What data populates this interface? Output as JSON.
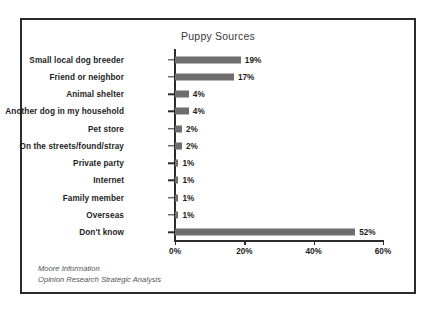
{
  "chart_data": {
    "type": "bar",
    "orientation": "horizontal",
    "title": "Puppy Sources",
    "xlabel": "",
    "ylabel": "",
    "xlim": [
      0,
      62
    ],
    "xticks": [
      0,
      20,
      40,
      60
    ],
    "xtick_labels": [
      "0%",
      "20%",
      "40%",
      "60%"
    ],
    "grid": false,
    "legend": null,
    "bar_color": "#6e6e6e",
    "categories": [
      "Small local dog breeder",
      "Friend or neighbor",
      "Animal shelter",
      "Another dog in my household",
      "Pet store",
      "On the streets/found/stray",
      "Private party",
      "Internet",
      "Family member",
      "Overseas",
      "Don't know"
    ],
    "values": [
      19,
      17,
      4,
      4,
      2,
      2,
      1,
      1,
      1,
      1,
      52
    ],
    "value_labels": [
      "19%",
      "17%",
      "4%",
      "4%",
      "2%",
      "2%",
      "1%",
      "1%",
      "1%",
      "1%",
      "52%"
    ],
    "annotations": [
      "Moore Information",
      "Opinion Research Strategic Analysis"
    ]
  },
  "source_note": {
    "line1": "Moore Information",
    "line2": "Opinion Research Strategic Analysis"
  }
}
